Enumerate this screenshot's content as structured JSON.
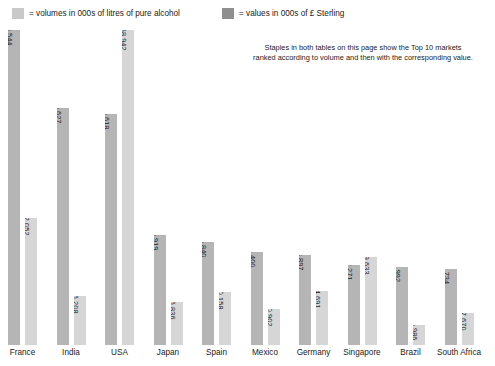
{
  "legend": {
    "items": [
      {
        "key": "volumes",
        "label": "= volumes in 000s of litres of pure alcohol",
        "color": "#c9c9c9",
        "swatch_name": "legend-swatch-volumes"
      },
      {
        "key": "values",
        "label": "= values in 000s of £ Sterling",
        "color": "#8f8f8f",
        "swatch_name": "legend-swatch-values"
      }
    ]
  },
  "annotation": {
    "line1": "Staples in both tables on this page show the Top 10 markets",
    "line2": "ranked according to volume and then with the corresponding value."
  },
  "chart_data": {
    "type": "bar",
    "title": "",
    "xlabel": "",
    "ylabel": "",
    "grid": false,
    "legend_position": "top-left",
    "categories": [
      "France",
      "India",
      "USA",
      "Japan",
      "Spain",
      "Mexico",
      "Germany",
      "Singapore",
      "Brazil",
      "South Africa"
    ],
    "series": [
      {
        "name": "volumes in 000s of litres of pure alcohol",
        "color": "#b5b5b5",
        "values": [
          48544,
          36627,
          35618,
          16919,
          15840,
          14400,
          13897,
          12271,
          11992,
          11734
        ],
        "labels": [
          "48 544",
          "36 627",
          "35 618",
          "16 919",
          "15 840",
          "14 400",
          "13 897",
          "12 271",
          "11 992",
          "11 734"
        ],
        "axis": "left",
        "ylim": [
          0,
          50000
        ]
      },
      {
        "name": "values in 000s of £ Sterling",
        "color": "#d6d6d6",
        "values": [
          432052,
          166208,
          1068942,
          146836,
          180158,
          120902,
          184691,
          299633,
          66986,
          107670
        ],
        "labels": [
          "432 052",
          "166 208",
          "1 068 942",
          "146 836",
          "180 158",
          "120 902",
          "184 691",
          "299 633",
          "66 986",
          "107 670"
        ],
        "axis": "right",
        "ylim": [
          0,
          1100000
        ]
      }
    ]
  }
}
